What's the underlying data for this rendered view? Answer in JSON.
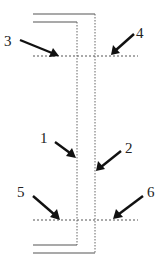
{
  "diagram": {
    "title": "",
    "labels": [
      {
        "id": "1",
        "text": "1",
        "target": "inner-vertical-line"
      },
      {
        "id": "2",
        "text": "2",
        "target": "outer-vertical-line"
      },
      {
        "id": "3",
        "text": "3",
        "target": "upper-horizontal-dashed-line-left"
      },
      {
        "id": "4",
        "text": "4",
        "target": "upper-horizontal-dashed-line-right"
      },
      {
        "id": "5",
        "text": "5",
        "target": "lower-horizontal-dashed-line-left"
      },
      {
        "id": "6",
        "text": "6",
        "target": "lower-horizontal-dashed-line-right"
      }
    ],
    "colors": {
      "line": "#555555",
      "arrow": "#111111",
      "background": "#ffffff"
    }
  }
}
